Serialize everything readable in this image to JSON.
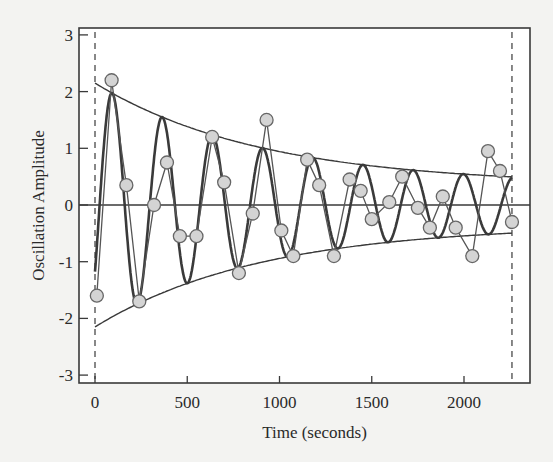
{
  "chart_data": {
    "type": "line",
    "title": "",
    "xlabel": "Time (seconds)",
    "ylabel": "Oscillation Amplitude",
    "xlim": [
      -80,
      2350
    ],
    "ylim": [
      -3.1,
      3.1
    ],
    "x_ticks": [
      0,
      500,
      1000,
      1500,
      2000
    ],
    "y_ticks": [
      -3,
      -2,
      -1,
      0,
      1,
      2,
      3
    ],
    "grid": false,
    "legend": null,
    "reference_lines": {
      "horizontal_zero": 0,
      "vertical_dashed": [
        0,
        2260
      ]
    },
    "series": [
      {
        "name": "measured",
        "style": "line-with-circle-markers",
        "x": [
          10,
          90,
          170,
          240,
          320,
          390,
          460,
          550,
          635,
          700,
          780,
          855,
          930,
          1010,
          1075,
          1150,
          1215,
          1295,
          1380,
          1440,
          1500,
          1595,
          1665,
          1750,
          1815,
          1885,
          1955,
          2045,
          2130,
          2195,
          2260
        ],
        "y": [
          -1.6,
          2.2,
          0.35,
          -1.7,
          0.0,
          0.75,
          -0.55,
          -0.55,
          1.2,
          0.4,
          -1.2,
          -0.15,
          1.5,
          -0.45,
          -0.9,
          0.8,
          0.35,
          -0.9,
          0.45,
          0.25,
          -0.25,
          0.05,
          0.5,
          -0.05,
          -0.4,
          0.15,
          -0.4,
          -0.9,
          0.95,
          0.6,
          -0.3
        ]
      },
      {
        "name": "damped-sinusoid-fit",
        "style": "thick-line",
        "function": "A(t)*sin(2*pi*(t-25)/272)",
        "t_range": [
          0,
          2260
        ]
      },
      {
        "name": "upper-envelope",
        "style": "thin-line",
        "function": "0.35 + 1.8*exp(-t/900)",
        "t_range": [
          0,
          2260
        ]
      },
      {
        "name": "lower-envelope",
        "style": "thin-line",
        "function": "-(0.35 + 1.8*exp(-t/900))",
        "t_range": [
          0,
          2260
        ]
      }
    ]
  },
  "colors": {
    "background": "#f3f3f1",
    "plot_background": "#ffffff",
    "line": "#3a3a3a",
    "marker_fill": "#d4d4d4",
    "marker_stroke": "#666666"
  },
  "layout": {
    "plot": {
      "left": 79,
      "top": 28,
      "right": 530,
      "bottom": 383
    },
    "x_px_at_0": 95,
    "x_px_per_unit": 0.1845,
    "y_px_at_0": 205,
    "y_px_per_unit": 56.7
  }
}
